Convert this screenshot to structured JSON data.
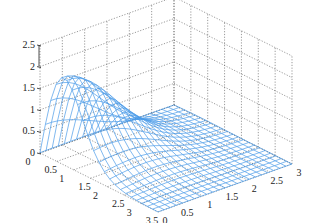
{
  "chart_data": {
    "type": "surface-mesh",
    "title": "",
    "xlabel": "",
    "ylabel": "",
    "zlabel": "",
    "x_ticks": [
      "0",
      "0.5",
      "1",
      "1.5",
      "2",
      "2.5",
      "3",
      "3.5"
    ],
    "y_ticks": [
      "0",
      "0.5",
      "1",
      "1.5",
      "2",
      "2.5",
      "3"
    ],
    "z_ticks": [
      "0",
      "0.5",
      "1",
      "1.5",
      "2",
      "2.5"
    ],
    "xlim": [
      0,
      3.5
    ],
    "ylim": [
      0,
      3
    ],
    "zlim": [
      0,
      2.5
    ],
    "grid": true,
    "mesh_color": "#4a9be8",
    "grid_color": "#555555",
    "function_description": "Mesh surface peaking at z≈2 near x≈0.7, y≈0, decaying to ~0 toward large x and y, with a ridge/saddle near the middle",
    "peak": {
      "x": 0.7,
      "y": 0,
      "z": 2.0
    },
    "mesh_resolution": [
      22,
      22
    ]
  }
}
